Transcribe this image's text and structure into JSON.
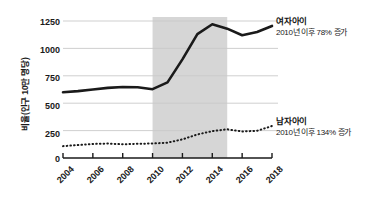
{
  "chart_data": {
    "type": "line",
    "title": "",
    "xlabel": "",
    "ylabel": "비율(인구 10만 명당)",
    "x": [
      2004,
      2005,
      2006,
      2007,
      2008,
      2009,
      2010,
      2011,
      2012,
      2013,
      2014,
      2015,
      2016,
      2017,
      2018
    ],
    "xticks": [
      "2004",
      "2006",
      "2008",
      "2010",
      "2012",
      "2014",
      "2016",
      "2018"
    ],
    "xtick_values": [
      2004,
      2006,
      2008,
      2010,
      2012,
      2014,
      2016,
      2018
    ],
    "yticks": [
      "0",
      "250",
      "500",
      "750",
      "1000",
      "1250"
    ],
    "ytick_values": [
      0,
      250,
      500,
      750,
      1000,
      1250
    ],
    "ylim": [
      0,
      1320
    ],
    "xlim": [
      2004,
      2018
    ],
    "grid": true,
    "legend_position": "right-annotations",
    "shaded_band": {
      "label": "",
      "x_start": 2010,
      "x_end": 2015,
      "color": "#d6d6d6"
    },
    "series": [
      {
        "name": "여자아이",
        "style": "solid",
        "color": "#1a1a1a",
        "values": [
          600,
          610,
          625,
          640,
          648,
          645,
          628,
          690,
          900,
          1130,
          1220,
          1180,
          1120,
          1150,
          1205
        ],
        "annotation_title": "여자아이",
        "annotation_sub": "2010년 이후 78% 증가"
      },
      {
        "name": "남자아이",
        "style": "dotted",
        "color": "#1a1a1a",
        "values": [
          108,
          118,
          128,
          132,
          125,
          130,
          132,
          140,
          170,
          215,
          245,
          262,
          242,
          248,
          292
        ],
        "annotation_title": "남자아이",
        "annotation_sub": "2010년 이후 134% 증가"
      }
    ]
  },
  "axis": {
    "y_title": "비율(인구 10만 명당)"
  }
}
